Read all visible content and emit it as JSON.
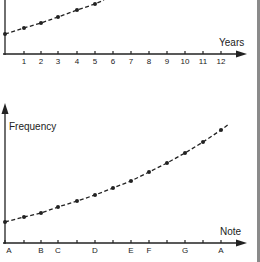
{
  "chart_data": [
    {
      "type": "line",
      "title": "",
      "xlabel": "Years",
      "ylabel": "",
      "x_tick_labels": [
        "1",
        "2",
        "3",
        "4",
        "5",
        "6",
        "7",
        "8",
        "9",
        "10",
        "11",
        "12"
      ],
      "x": [
        0,
        1,
        2,
        3,
        4,
        5
      ],
      "values_px_y": [
        34,
        28,
        23,
        17,
        10,
        4
      ],
      "description": "Dashed exponential growth curve with dot markers, continuing above the visible area",
      "grid": false,
      "legend": null
    },
    {
      "type": "line",
      "title": "",
      "xlabel": "Note",
      "ylabel": "Frequency",
      "x_tick_labels": [
        "A",
        "",
        "B",
        "C",
        "",
        "D",
        "",
        "E",
        "F",
        "",
        "G",
        "",
        "A"
      ],
      "x": [
        0,
        1,
        2,
        3,
        4,
        5,
        6,
        7,
        8,
        9,
        10,
        11,
        12
      ],
      "values_px_y": [
        222,
        217,
        213,
        207,
        201,
        195,
        188,
        181,
        172,
        163,
        153,
        142,
        130
      ],
      "description": "Dashed exponential curve of note frequency across a chromatic octave (A to A), dot markers at each semitone",
      "grid": false,
      "legend": null
    }
  ],
  "top_chart": {
    "xlabel": "Years",
    "ticks": [
      "1",
      "2",
      "3",
      "4",
      "5",
      "6",
      "7",
      "8",
      "9",
      "10",
      "11",
      "12"
    ]
  },
  "bottom_chart": {
    "ylabel": "Frequency",
    "xlabel": "Note",
    "note_labels": [
      "A",
      "B",
      "C",
      "D",
      "E",
      "F",
      "G",
      "A"
    ]
  },
  "colors": {
    "ink": "#222222",
    "border": "#8a8a8a",
    "background": "#ffffff"
  }
}
